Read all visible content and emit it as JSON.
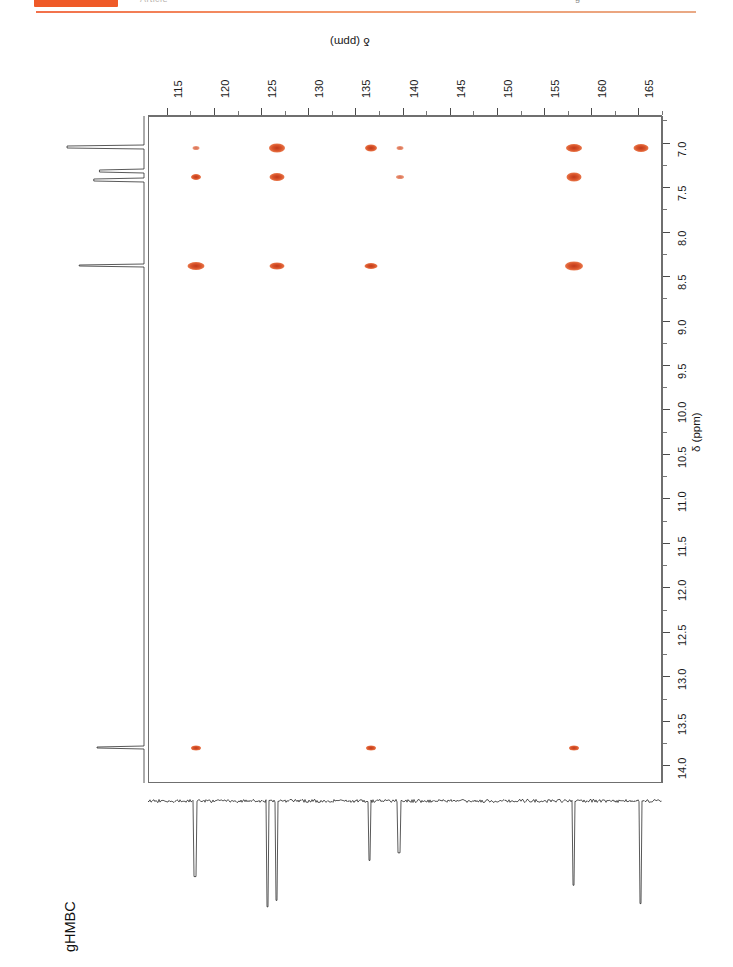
{
  "header": {
    "badge_label": "",
    "journal_text": "Article",
    "right_mark": "g"
  },
  "figure": {
    "experiment_label": "gHMBC",
    "f1_axis_title": "δ (ppm)",
    "f2_axis_title": "δ (ppm)"
  },
  "colors": {
    "peak": "#d9542a",
    "peak_core": "#c0391a",
    "accent_rule": "#f2704a",
    "badge": "#ef5a28",
    "frame": "#6f6f6f",
    "trace": "#222222"
  },
  "chart_data": {
    "type": "scatter",
    "title": "gHMBC",
    "xlabel": "δ (ppm)",
    "ylabel": "δ (ppm)",
    "xlim": [
      113.0,
      167.5
    ],
    "ylim": [
      6.7,
      14.2
    ],
    "x_axis_position": "top",
    "y_axis_position": "right",
    "x_axis_direction": "reversed-rotated",
    "grid": false,
    "legend": false,
    "x_major_ticks": [
      115,
      120,
      125,
      130,
      135,
      140,
      145,
      150,
      155,
      160,
      165
    ],
    "x_tick_labels": [
      "115",
      "120",
      "125",
      "130",
      "135",
      "140",
      "145",
      "150",
      "155",
      "160",
      "165"
    ],
    "x_minor_step": 2.5,
    "y_major_ticks": [
      7.0,
      7.5,
      8.0,
      8.5,
      9.0,
      9.5,
      10.0,
      10.5,
      11.0,
      11.5,
      12.0,
      12.5,
      13.0,
      13.5,
      14.0
    ],
    "y_tick_labels": [
      "7.0",
      "7.5",
      "8.0",
      "8.5",
      "9.0",
      "9.5",
      "10.0",
      "10.5",
      "11.0",
      "11.5",
      "12.0",
      "12.5",
      "13.0",
      "13.5",
      "14.0"
    ],
    "y_minor_step": 0.25,
    "peaks": [
      {
        "c": 118.0,
        "h": 7.05,
        "w": 7,
        "h_px": 4,
        "intensity": "weak"
      },
      {
        "c": 126.6,
        "h": 7.05,
        "w": 16,
        "h_px": 9,
        "intensity": "strong"
      },
      {
        "c": 136.5,
        "h": 7.05,
        "w": 12,
        "h_px": 7,
        "intensity": "medium"
      },
      {
        "c": 139.6,
        "h": 7.05,
        "w": 7,
        "h_px": 4,
        "intensity": "weak"
      },
      {
        "c": 158.1,
        "h": 7.05,
        "w": 16,
        "h_px": 8,
        "intensity": "strong"
      },
      {
        "c": 165.2,
        "h": 7.05,
        "w": 15,
        "h_px": 8,
        "intensity": "strong"
      },
      {
        "c": 118.0,
        "h": 7.38,
        "w": 10,
        "h_px": 6,
        "intensity": "medium"
      },
      {
        "c": 126.6,
        "h": 7.38,
        "w": 15,
        "h_px": 8,
        "intensity": "strong"
      },
      {
        "c": 139.6,
        "h": 7.38,
        "w": 8,
        "h_px": 4,
        "intensity": "weak"
      },
      {
        "c": 158.1,
        "h": 7.38,
        "w": 15,
        "h_px": 9,
        "intensity": "strong"
      },
      {
        "c": 118.0,
        "h": 8.38,
        "w": 17,
        "h_px": 8,
        "intensity": "strong"
      },
      {
        "c": 126.6,
        "h": 8.38,
        "w": 15,
        "h_px": 7,
        "intensity": "strong"
      },
      {
        "c": 136.5,
        "h": 8.38,
        "w": 13,
        "h_px": 6,
        "intensity": "medium"
      },
      {
        "c": 158.1,
        "h": 8.38,
        "w": 18,
        "h_px": 9,
        "intensity": "strong"
      },
      {
        "c": 118.0,
        "h": 13.8,
        "w": 10,
        "h_px": 5,
        "intensity": "medium"
      },
      {
        "c": 136.5,
        "h": 13.8,
        "w": 10,
        "h_px": 5,
        "intensity": "medium"
      },
      {
        "c": 158.1,
        "h": 13.8,
        "w": 10,
        "h_px": 5,
        "intensity": "medium"
      }
    ],
    "f1_projection": {
      "description": "13C projection, peaks pointing downward",
      "peaks_ppm": [
        118.0,
        125.7,
        126.6,
        136.5,
        139.6,
        158.1,
        165.2
      ],
      "depths": [
        0.7,
        0.98,
        0.92,
        0.55,
        0.48,
        0.78,
        0.95
      ]
    },
    "f2_projection": {
      "description": "1H projection, peaks pointing left",
      "peaks_ppm": [
        7.05,
        7.32,
        7.42,
        8.38,
        13.8
      ],
      "lengths": [
        0.95,
        0.55,
        0.62,
        0.8,
        0.58
      ]
    }
  }
}
